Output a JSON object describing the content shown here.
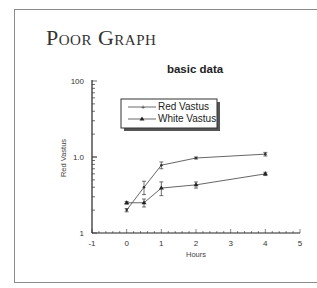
{
  "slide": {
    "title": "Poor Graph"
  },
  "chart_data": {
    "type": "line",
    "title": "basic data",
    "xlabel": "Hours",
    "ylabel": "Red Vastus",
    "xlim": [
      -1,
      5
    ],
    "ylim": [
      1,
      100
    ],
    "yscale": "log",
    "x_ticks": [
      "-1",
      "0",
      "1",
      "2",
      "3",
      "4",
      "5"
    ],
    "y_ticks": [
      "1",
      "10",
      "100"
    ],
    "legend_position": "upper left (boxed, with drop shadow)",
    "grid": false,
    "series": [
      {
        "name": "Red Vastus",
        "marker": "plus",
        "x": [
          0,
          0.5,
          1,
          2,
          4
        ],
        "values": [
          2.0,
          4.0,
          7.8,
          9.7,
          10.9
        ],
        "error": [
          0.1,
          0.8,
          0.8,
          0.3,
          0.6
        ]
      },
      {
        "name": "White Vastus",
        "marker": "triangle",
        "x": [
          0,
          0.5,
          1,
          2,
          4
        ],
        "values": [
          2.5,
          2.5,
          3.9,
          4.3,
          6.0
        ],
        "error": [
          0.1,
          0.3,
          0.8,
          0.4,
          0.3
        ]
      }
    ]
  }
}
